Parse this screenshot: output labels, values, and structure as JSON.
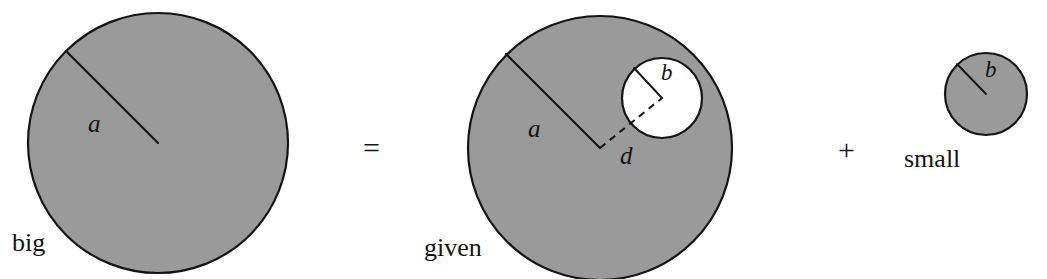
{
  "figure": {
    "caption_type": "geometry-decomposition-equation",
    "background_color": "#ffffff",
    "disk_fill_color": "#9a9a9a",
    "outline_color": "#141414",
    "hole_fill_color": "#ffffff"
  },
  "terms": {
    "big": {
      "name": "big",
      "radius_symbol": "a",
      "circle": {
        "cx": 158,
        "cy": 143,
        "r": 130
      },
      "radius_line": {
        "x1": 158,
        "y1": 143,
        "x2": 66,
        "y2": 51
      },
      "radius_symbol_pos": {
        "x": 88,
        "y": 132
      },
      "name_pos": {
        "x": 12,
        "y": 251
      }
    },
    "given": {
      "name": "given",
      "radius_symbol": "a",
      "hole_radius_symbol": "b",
      "distance_symbol": "d",
      "circle": {
        "cx": 600,
        "cy": 148,
        "r": 132
      },
      "hole": {
        "cx": 662,
        "cy": 98,
        "r": 40
      },
      "radius_line": {
        "x1": 600,
        "y1": 148,
        "x2": 506,
        "y2": 54
      },
      "radius_symbol_pos": {
        "x": 528,
        "y": 137
      },
      "hole_radius_line": {
        "x1": 662,
        "y1": 98,
        "x2": 634,
        "y2": 68
      },
      "hole_radius_symbol_pos": {
        "x": 661,
        "y": 80
      },
      "distance_line": {
        "x1": 600,
        "y1": 148,
        "x2": 662,
        "y2": 98
      },
      "distance_symbol_pos": {
        "x": 620,
        "y": 164
      },
      "name_pos": {
        "x": 424,
        "y": 256
      }
    },
    "small": {
      "name": "small",
      "radius_symbol": "b",
      "circle": {
        "cx": 986,
        "cy": 94,
        "r": 41
      },
      "radius_line": {
        "x1": 986,
        "y1": 94,
        "x2": 957,
        "y2": 64
      },
      "radius_symbol_pos": {
        "x": 985,
        "y": 77
      },
      "name_pos": {
        "x": 904,
        "y": 167
      }
    }
  },
  "operators": {
    "equals": {
      "symbol": "=",
      "x": 363,
      "y": 158
    },
    "plus": {
      "symbol": "+",
      "x": 838,
      "y": 160
    }
  }
}
